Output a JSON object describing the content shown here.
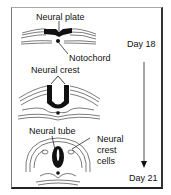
{
  "diagram": {
    "stages": [
      {
        "id": "stage-1",
        "labels": [
          "Neural plate",
          "Notochord"
        ]
      },
      {
        "id": "stage-2",
        "labels": [
          "Neural crest"
        ]
      },
      {
        "id": "stage-3",
        "labels": [
          "Neural tube",
          "Neural crest cells"
        ]
      }
    ],
    "labels": {
      "neural_plate": "Neural plate",
      "notochord": "Notochord",
      "neural_crest": "Neural crest",
      "neural_tube": "Neural tube",
      "neural_crest_cells_1": "Neural",
      "neural_crest_cells_2": "crest",
      "neural_crest_cells_3": "cells"
    },
    "timeline": {
      "start": "Day 18",
      "end": "Day 21",
      "arrow_direction": "down"
    }
  }
}
